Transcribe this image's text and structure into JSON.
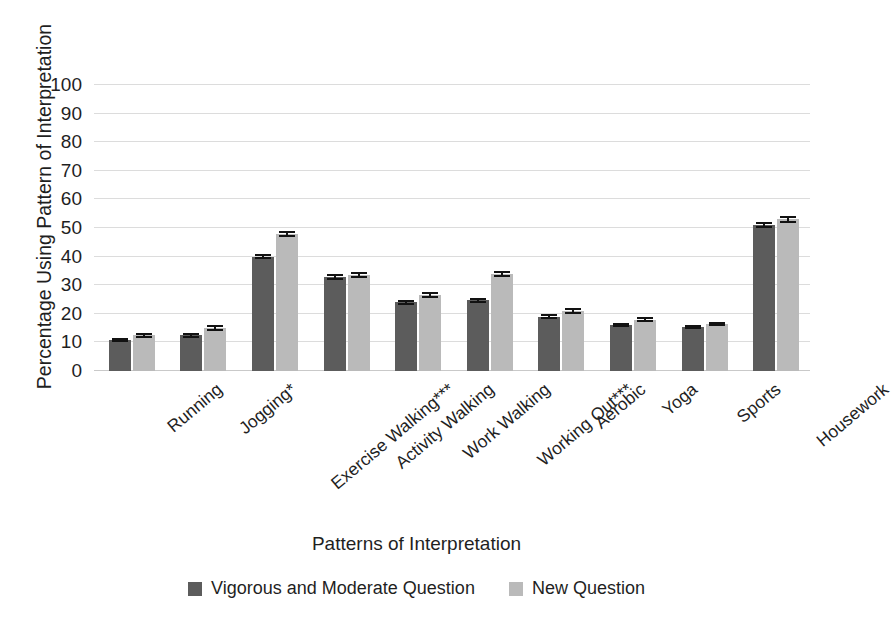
{
  "chart_data": {
    "type": "bar",
    "title": "",
    "xlabel": "Patterns of Interpretation",
    "ylabel": "Percentage Using Pattern of Interpretation",
    "ylim": [
      0,
      100
    ],
    "ytick_step": 10,
    "yticks": [
      100,
      90,
      80,
      70,
      60,
      50,
      40,
      30,
      20,
      10,
      0
    ],
    "grid": true,
    "grid_axis": "y",
    "legend_position": "bottom-center",
    "categories": [
      "Running",
      "Jogging*",
      "Exercise Walking***",
      "Activity Walking",
      "Work Walking",
      "Working Out***",
      "Aerobic",
      "Yoga",
      "Sports",
      "Housework"
    ],
    "series": [
      {
        "name": "Vigorous and Moderate Question",
        "color": "#5c5c5c",
        "values": [
          11.0,
          12.5,
          40.0,
          32.8,
          24.0,
          24.8,
          19.0,
          16.0,
          15.5,
          51.0
        ],
        "errors": [
          0.7,
          0.8,
          1.0,
          1.0,
          0.9,
          0.9,
          0.8,
          0.7,
          0.7,
          1.1
        ]
      },
      {
        "name": "New Question",
        "color": "#bababa",
        "values": [
          12.5,
          15.0,
          48.0,
          33.5,
          26.5,
          34.0,
          21.0,
          18.0,
          16.5,
          53.0
        ],
        "errors": [
          0.9,
          1.0,
          1.1,
          1.1,
          1.0,
          1.1,
          0.9,
          0.8,
          0.8,
          1.1
        ]
      }
    ]
  },
  "legend": {
    "items": [
      {
        "label": "Vigorous and Moderate Question",
        "color": "#5c5c5c"
      },
      {
        "label": "New Question",
        "color": "#bababa"
      }
    ]
  },
  "colors": {
    "series_dark": "#5c5c5c",
    "series_light": "#bababa",
    "gridline": "#dcdcdc",
    "text": "#1f1f1f",
    "error_bar": "#121212"
  }
}
